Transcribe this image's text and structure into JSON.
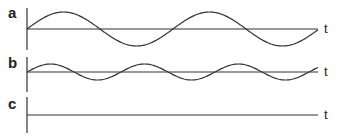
{
  "panels": [
    {
      "label": "a",
      "time_label": "t",
      "baseline_y": 29,
      "amplitude": 17,
      "period": 146,
      "description": "large-amplitude sine wave"
    },
    {
      "label": "b",
      "time_label": "t",
      "baseline_y": 72,
      "amplitude": 8,
      "period": 94,
      "description": "smaller-amplitude higher-frequency sine wave"
    },
    {
      "label": "c",
      "time_label": "t",
      "baseline_y": 115,
      "amplitude": 0,
      "period": 0,
      "description": "flat line"
    }
  ],
  "colors": {
    "line": "#333333",
    "text": "#222222"
  }
}
